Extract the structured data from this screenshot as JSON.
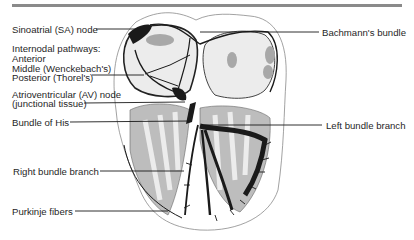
{
  "diagram": {
    "labels": {
      "sa_node": "Sinoatrial (SA) node",
      "internodal_heading": "Internodal pathways:",
      "internodal_anterior": "Anterior",
      "internodal_middle": "Middle (Wenckebach's)",
      "internodal_posterior": "Posterior (Thorel's)",
      "av_node_line1": "Atrioventricular (AV) node",
      "av_node_line2": "(junctional tissue)",
      "bundle_of_his": "Bundle of His",
      "right_bundle_branch": "Right bundle branch",
      "purkinje_fibers": "Purkinje fibers",
      "bachmanns_bundle": "Bachmann's bundle",
      "left_bundle_branch": "Left bundle branch"
    },
    "colors": {
      "ink": "#1a1a1a",
      "tissue_gray": "#9a9a9a",
      "light_gray": "#d6d6d6",
      "rule": "#8a8a8a"
    }
  }
}
